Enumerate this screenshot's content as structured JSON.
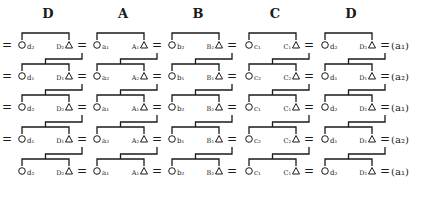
{
  "columns": [
    {
      "header": "D",
      "x": 48
    },
    {
      "header": "A",
      "x": 123
    },
    {
      "header": "B",
      "x": 198
    },
    {
      "header": "C",
      "x": 275
    },
    {
      "header": "D",
      "x": 351
    }
  ],
  "rows": [
    {
      "tag": "(a₁)",
      "leading_equals": true,
      "cells": [
        [
          "d₂",
          "D₂"
        ],
        [
          "a₁",
          "A₁"
        ],
        [
          "b₂",
          "B₂"
        ],
        [
          "c₁",
          "C₁"
        ],
        [
          "d₂",
          "D₂"
        ]
      ]
    },
    {
      "tag": "(a₂)",
      "leading_equals": true,
      "cells": [
        [
          "d₁",
          "D₁"
        ],
        [
          "a₂",
          "A₂"
        ],
        [
          "b₁",
          "B₁"
        ],
        [
          "c₂",
          "C₂"
        ],
        [
          "d₁",
          "D₁"
        ]
      ]
    },
    {
      "tag": "(a₁)",
      "leading_equals": true,
      "cells": [
        [
          "d₂",
          "D₂"
        ],
        [
          "a₁",
          "A₁"
        ],
        [
          "b₂",
          "B₂"
        ],
        [
          "c₁",
          "C₁"
        ],
        [
          "d₂",
          "D₂"
        ]
      ]
    },
    {
      "tag": "(a₂)",
      "leading_equals": true,
      "cells": [
        [
          "d₁",
          "D₁"
        ],
        [
          "a₂",
          "A₂"
        ],
        [
          "b₁",
          "B₁"
        ],
        [
          "c₂",
          "C₂"
        ],
        [
          "d₁",
          "D₁"
        ]
      ]
    },
    {
      "tag": "(a₁)",
      "leading_equals": false,
      "cells": [
        [
          "d₂",
          "D₂"
        ],
        [
          "a₁",
          "A₁"
        ],
        [
          "b₂",
          "B₂"
        ],
        [
          "c₁",
          "C₁"
        ],
        [
          "d₂",
          "D₂"
        ]
      ]
    }
  ],
  "symbols": {
    "equals": "=",
    "female": "circle",
    "male": "triangle"
  },
  "caption": "Fig. ... (after Deacon 1935)"
}
